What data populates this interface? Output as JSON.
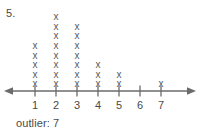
{
  "problem": {
    "number_label": "5."
  },
  "answer": {
    "text": "outlier: 7"
  },
  "colors": {
    "mark": "#59595b",
    "axis": "#6b6b6d",
    "text": "#4a4a4a",
    "background": "#ffffff"
  },
  "axis": {
    "left_arrow": true,
    "right_arrow": true,
    "tick_labels": [
      "1",
      "2",
      "3",
      "4",
      "5",
      "6",
      "7"
    ]
  },
  "marks": {
    "glyph": "x"
  },
  "chart_data": {
    "type": "dot-plot",
    "title": "",
    "xlabel": "",
    "ylabel": "",
    "categories": [
      1,
      2,
      3,
      4,
      5,
      6,
      7
    ],
    "values": [
      5,
      8,
      7,
      3,
      2,
      0,
      1
    ],
    "counts": [
      {
        "x": 1,
        "count": 5
      },
      {
        "x": 2,
        "count": 8
      },
      {
        "x": 3,
        "count": 7
      },
      {
        "x": 4,
        "count": 3
      },
      {
        "x": 5,
        "count": 2
      },
      {
        "x": 6,
        "count": 0
      },
      {
        "x": 7,
        "count": 1
      }
    ],
    "total_marks": 26,
    "xlim": [
      1,
      7
    ],
    "grid": false,
    "legend": null,
    "annotations": [
      "outlier: 7"
    ],
    "marker": "x"
  }
}
